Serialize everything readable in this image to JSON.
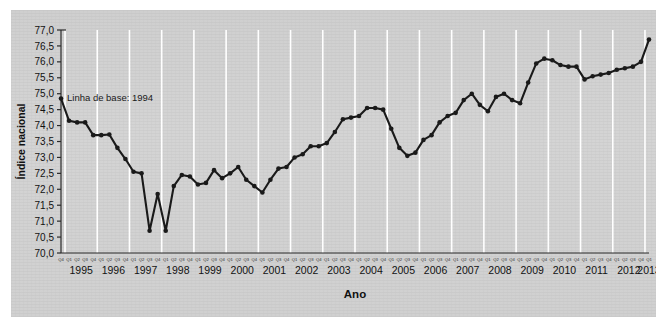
{
  "figure": {
    "panel_background": "#d2d2d2",
    "page_background": "#ffffff",
    "series_color": "#1a1a1a",
    "gridline_color": "#ffffff",
    "axis_color": "#2a2a2a"
  },
  "chart_data": {
    "type": "line",
    "title": "",
    "subtitle": "",
    "xlabel": "Ano",
    "ylabel": "Índice nacional",
    "ylim": [
      70.0,
      77.0
    ],
    "ytick_labels": [
      "70,0",
      "70,5",
      "71,0",
      "71,5",
      "72,0",
      "72,5",
      "73,0",
      "73,5",
      "74,0",
      "74,5",
      "75,0",
      "75,5",
      "76,0",
      "76,5",
      "77,0"
    ],
    "ytick_values": [
      70.0,
      70.5,
      71.0,
      71.5,
      72.0,
      72.5,
      73.0,
      73.5,
      74.0,
      74.5,
      75.0,
      75.5,
      76.0,
      76.5,
      77.0
    ],
    "grid": "vertical-only",
    "grid_on": true,
    "legend": "none",
    "marker": "circle",
    "years": [
      "1995",
      "1996",
      "1997",
      "1998",
      "1999",
      "2000",
      "2001",
      "2002",
      "2003",
      "2004",
      "2005",
      "2006",
      "2007",
      "2008",
      "2009",
      "2010",
      "2011",
      "2012",
      "2013"
    ],
    "quarter_labels": [
      "Q1",
      "Q2",
      "Q3",
      "Q4"
    ],
    "first_quarter_label": "Q4",
    "annotations": [
      {
        "text": "Linha de base: 1994",
        "x": "1994Q4",
        "y": 74.85
      }
    ],
    "x": [
      "1994Q4",
      "1995Q1",
      "1995Q2",
      "1995Q3",
      "1995Q4",
      "1996Q1",
      "1996Q2",
      "1996Q3",
      "1996Q4",
      "1997Q1",
      "1997Q2",
      "1997Q3",
      "1997Q4",
      "1998Q1",
      "1998Q2",
      "1998Q3",
      "1998Q4",
      "1999Q1",
      "1999Q2",
      "1999Q3",
      "1999Q4",
      "2000Q1",
      "2000Q2",
      "2000Q3",
      "2000Q4",
      "2001Q1",
      "2001Q2",
      "2001Q3",
      "2001Q4",
      "2002Q1",
      "2002Q2",
      "2002Q3",
      "2002Q4",
      "2003Q1",
      "2003Q2",
      "2003Q3",
      "2003Q4",
      "2004Q1",
      "2004Q2",
      "2004Q3",
      "2004Q4",
      "2005Q1",
      "2005Q2",
      "2005Q3",
      "2005Q4",
      "2006Q1",
      "2006Q2",
      "2006Q3",
      "2006Q4",
      "2007Q1",
      "2007Q2",
      "2007Q3",
      "2007Q4",
      "2008Q1",
      "2008Q2",
      "2008Q3",
      "2008Q4",
      "2009Q1",
      "2009Q2",
      "2009Q3",
      "2009Q4",
      "2010Q1",
      "2010Q2",
      "2010Q3",
      "2010Q4",
      "2011Q1",
      "2011Q2",
      "2011Q3",
      "2011Q4",
      "2012Q1",
      "2012Q2",
      "2012Q3",
      "2012Q4",
      "2013Q1"
    ],
    "values": [
      74.85,
      74.15,
      74.1,
      74.1,
      73.7,
      73.7,
      73.72,
      73.3,
      72.95,
      72.55,
      72.5,
      70.7,
      71.85,
      70.7,
      72.1,
      72.45,
      72.4,
      72.15,
      72.2,
      72.6,
      72.35,
      72.5,
      72.7,
      72.3,
      72.1,
      71.9,
      72.3,
      72.65,
      72.7,
      73.0,
      73.1,
      73.35,
      73.35,
      73.45,
      73.8,
      74.2,
      74.25,
      74.3,
      74.55,
      74.55,
      74.5,
      73.9,
      73.3,
      73.05,
      73.15,
      73.55,
      73.7,
      74.1,
      74.3,
      74.4,
      74.8,
      75.0,
      74.65,
      74.45,
      74.9,
      75.0,
      74.8,
      74.7,
      75.35,
      75.95,
      76.1,
      76.05,
      75.9,
      75.85,
      75.85,
      75.45,
      75.55,
      75.6,
      75.65,
      75.75,
      75.8,
      75.85,
      76.0,
      76.7
    ]
  }
}
